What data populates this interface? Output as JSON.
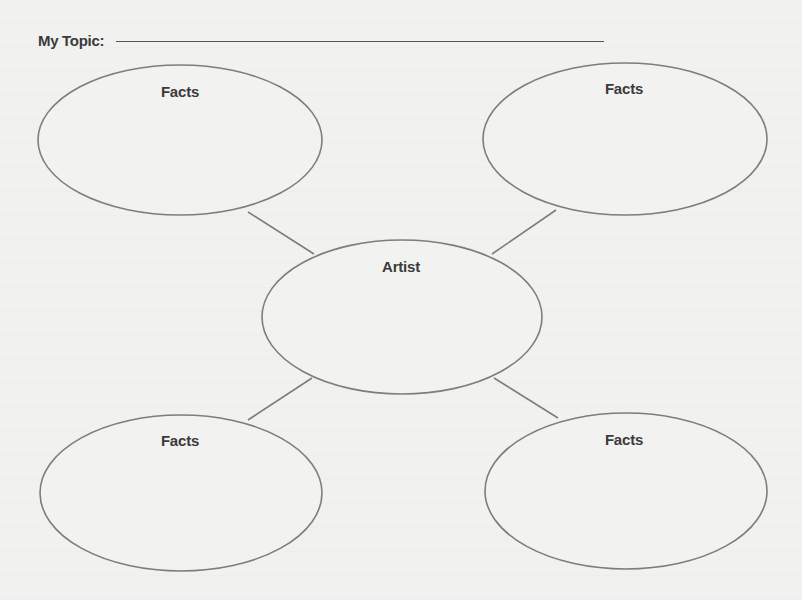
{
  "worksheet": {
    "topic_label": "My Topic:",
    "topic_value": "",
    "center_node": {
      "label": "Artist"
    },
    "outer_nodes": [
      {
        "position": "top-left",
        "label": "Facts"
      },
      {
        "position": "top-right",
        "label": "Facts"
      },
      {
        "position": "bottom-left",
        "label": "Facts"
      },
      {
        "position": "bottom-right",
        "label": "Facts"
      }
    ]
  },
  "colors": {
    "paper": "#f1f1ef",
    "ink": "#3b3b3b",
    "line": "#7a7a7a"
  }
}
